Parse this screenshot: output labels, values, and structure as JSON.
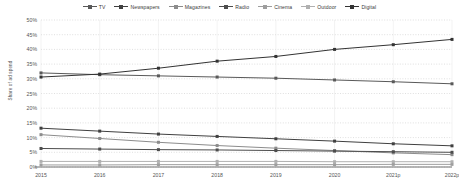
{
  "chart_data": {
    "type": "line",
    "title": "",
    "xlabel": "",
    "ylabel": "Share of ad spend",
    "categories": [
      "2015",
      "2016",
      "2017",
      "2018",
      "2019",
      "2020",
      "2021p",
      "2022p"
    ],
    "ylim": [
      0,
      50
    ],
    "ytick_labels": [
      "0%",
      "5%",
      "10%",
      "15%",
      "20%",
      "25%",
      "30%",
      "35%",
      "40%",
      "45%",
      "50%"
    ],
    "ytick_values": [
      0,
      5,
      10,
      15,
      20,
      25,
      30,
      35,
      40,
      45,
      50
    ],
    "grid": true,
    "legend_position": "top",
    "series": [
      {
        "name": "TV",
        "color": "#595959",
        "values": [
          32.0,
          31.4,
          31.0,
          30.6,
          30.2,
          29.6,
          29.0,
          28.3
        ]
      },
      {
        "name": "Newspapers",
        "color": "#404040",
        "values": [
          13.2,
          12.2,
          11.2,
          10.4,
          9.6,
          8.8,
          7.9,
          7.2
        ]
      },
      {
        "name": "Magazines",
        "color": "#8c8c8c",
        "values": [
          11.0,
          9.7,
          8.4,
          7.3,
          6.4,
          5.6,
          4.8,
          4.2
        ]
      },
      {
        "name": "Radio",
        "color": "#4d4d4d",
        "values": [
          6.3,
          6.1,
          5.9,
          5.8,
          5.6,
          5.4,
          5.2,
          5.0
        ]
      },
      {
        "name": "Cinema",
        "color": "#9e9e9e",
        "values": [
          0.7,
          0.7,
          0.8,
          0.8,
          0.8,
          0.8,
          0.9,
          0.9
        ]
      },
      {
        "name": "Outdoor",
        "color": "#b0b0b0",
        "values": [
          1.9,
          1.9,
          1.9,
          1.9,
          1.9,
          1.8,
          1.8,
          1.8
        ]
      },
      {
        "name": "Digital",
        "color": "#333333",
        "values": [
          30.6,
          31.6,
          33.6,
          36.0,
          37.6,
          40.0,
          41.6,
          43.4
        ]
      }
    ]
  }
}
